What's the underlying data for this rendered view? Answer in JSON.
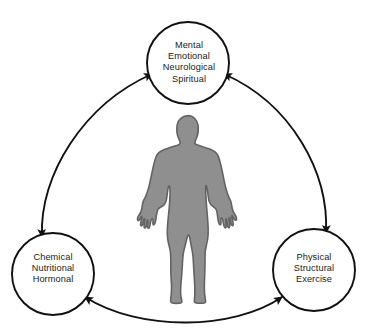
{
  "diagram": {
    "type": "triangular-cycle",
    "background_color": "#ffffff",
    "stroke_color": "#1a1a1a",
    "nodes": [
      {
        "id": "mental",
        "position": "top",
        "lines": [
          "Mental",
          "Emotional",
          "Neurological",
          "Spiritual"
        ],
        "cx": 188,
        "cy": 63,
        "r": 41
      },
      {
        "id": "chemical",
        "position": "bottom-left",
        "lines": [
          "Chemical",
          "Nutritional",
          "Hormonal"
        ],
        "cx": 53,
        "cy": 274,
        "r": 41
      },
      {
        "id": "physical",
        "position": "bottom-right",
        "lines": [
          "Physical",
          "Structural",
          "Exercise"
        ],
        "cx": 314,
        "cy": 270,
        "r": 41
      }
    ],
    "connectors": [
      {
        "id": "left-connector",
        "from": "chemical",
        "to": "mental",
        "style": "curved",
        "arrowheads": "both"
      },
      {
        "id": "right-connector",
        "from": "mental",
        "to": "physical",
        "style": "curved",
        "arrowheads": "both"
      },
      {
        "id": "bottom-connector",
        "from": "chemical",
        "to": "physical",
        "style": "curved",
        "arrowheads": "both"
      }
    ],
    "center_figure": {
      "name": "human-body-silhouette",
      "fill_color": "#8f8f8f",
      "outline_color": "#636363"
    }
  }
}
